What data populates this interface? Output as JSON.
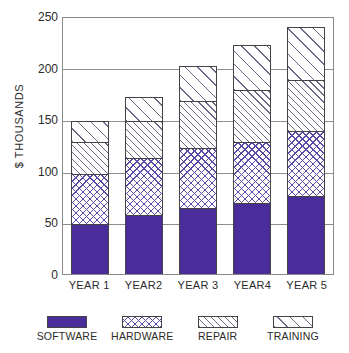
{
  "chart_data": {
    "type": "bar",
    "subtype": "stacked-bar",
    "title": "",
    "xlabel": "",
    "ylabel": "$ THOUSANDS",
    "categories": [
      "YEAR 1",
      "YEAR2",
      "YEAR 3",
      "YEAR4",
      "YEAR 5"
    ],
    "series": [
      {
        "name": "SOFTWARE",
        "values": [
          48,
          57,
          64,
          69,
          76
        ],
        "color": "#4a2c9b",
        "pattern": "solid"
      },
      {
        "name": "HARDWARE",
        "values": [
          49,
          55,
          58,
          59,
          63
        ],
        "color": "#5b4ba6",
        "pattern": "crosshatch"
      },
      {
        "name": "REPAIR",
        "values": [
          31,
          36,
          46,
          50,
          49
        ],
        "color": "#6a6a86",
        "pattern": "diagonal-dense"
      },
      {
        "name": "TRAINING",
        "values": [
          20,
          24,
          34,
          44,
          51
        ],
        "color": "#6a6a86",
        "pattern": "diagonal-sparse"
      }
    ],
    "cumulative_tops": [
      [
        48,
        97,
        128,
        148
      ],
      [
        57,
        112,
        148,
        172
      ],
      [
        64,
        122,
        168,
        202
      ],
      [
        69,
        128,
        178,
        222
      ],
      [
        76,
        139,
        188,
        239
      ]
    ],
    "totals": [
      148,
      172,
      202,
      222,
      239
    ],
    "ylim": [
      0,
      250
    ],
    "yticks": [
      0,
      50,
      100,
      150,
      200,
      250
    ],
    "ytick_labels": [
      "0",
      "50",
      "100",
      "150",
      "200",
      "250"
    ],
    "grid": true,
    "grid_axis": "y",
    "legend_position": "bottom",
    "legend": [
      "SOFTWARE",
      "HARDWARE",
      "REPAIR",
      "TRAINING"
    ]
  }
}
